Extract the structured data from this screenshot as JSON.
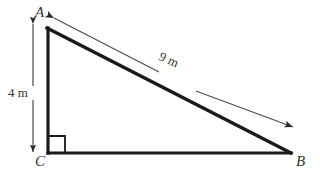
{
  "figure": {
    "type": "geometry-diagram",
    "shape": "right-triangle",
    "background_color": "#ffffff",
    "stroke_color": "#1a1a1a",
    "dimension_line_color": "#555555",
    "text_color": "#333333",
    "vertices": {
      "a": {
        "label": "A",
        "x": 48,
        "y": 28
      },
      "b": {
        "label": "B",
        "x": 290,
        "y": 153
      },
      "c": {
        "label": "C",
        "x": 48,
        "y": 153
      }
    },
    "right_angle": {
      "at_vertex": "C",
      "marker": "square",
      "size": 17
    },
    "dimensions": [
      {
        "name": "vertical-side",
        "label": "4 m",
        "value": 4,
        "unit": "m",
        "between": [
          "A",
          "C"
        ],
        "arrow": "double-headed",
        "orientation": "vertical"
      },
      {
        "name": "hypotenuse",
        "label": "9 m",
        "value": 9,
        "unit": "m",
        "between": [
          "A",
          "B"
        ],
        "arrow": "double-headed",
        "orientation": "diagonal",
        "rotation_deg": 24.6
      }
    ]
  }
}
